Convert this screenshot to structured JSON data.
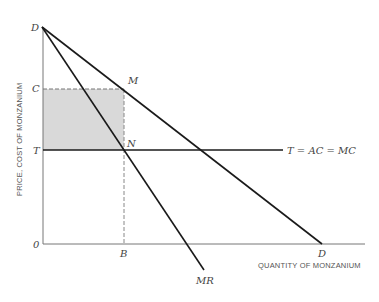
{
  "diagram": {
    "type": "monopoly-pricing",
    "axes": {
      "y_label": "PRICE, COST OF MONZANIUM",
      "x_label": "QUANTITY OF MONZANIUM",
      "origin_label": "0"
    },
    "points": {
      "demand_top": "D",
      "demand_bottom": "D",
      "price_level": "C",
      "cost_level": "T",
      "monopoly_point": "M",
      "cost_point": "N",
      "quantity": "B"
    },
    "curves": {
      "cost_line": "T = AC = MC",
      "marginal_revenue": "MR"
    },
    "shaded_region": "monopoly-profit rectangle C-M-N-T",
    "colors": {
      "line": "#1a1a1a",
      "axis": "#666666",
      "shade": "#d9d9d9",
      "dashed": "#777777"
    }
  }
}
